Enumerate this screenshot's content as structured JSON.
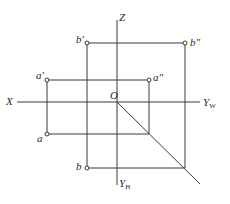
{
  "diagram": {
    "type": "orthographic-projection",
    "colors": {
      "line": "#3a3a3a",
      "background": "#ffffff",
      "text": "#2a2a2a"
    },
    "axes": {
      "x": {
        "label": "X"
      },
      "z": {
        "label": "Z"
      },
      "yw": {
        "label": "Y",
        "sub": "W"
      },
      "yh": {
        "label": "Y",
        "sub": "H"
      },
      "origin": {
        "label": "O"
      }
    },
    "points": {
      "a_front": {
        "label": "a′"
      },
      "a_side": {
        "label": "a″"
      },
      "a_top": {
        "label": "a"
      },
      "b_front": {
        "label": "b′"
      },
      "b_side": {
        "label": "b″"
      },
      "b_top": {
        "label": "b"
      }
    }
  }
}
